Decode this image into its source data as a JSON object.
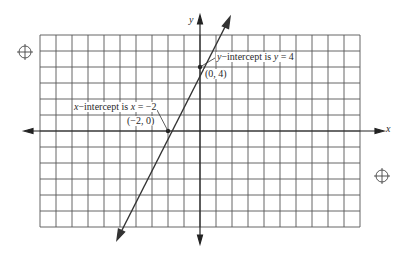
{
  "chart_data": {
    "type": "line",
    "title": "",
    "xlabel": "x",
    "ylabel": "y",
    "xlim": [
      -10,
      10
    ],
    "ylim": [
      -6,
      6
    ],
    "grid": true,
    "grid_step": 1,
    "equation": "y = 2x + 4",
    "series": [
      {
        "name": "line",
        "x": [
          -5,
          -2,
          0,
          1
        ],
        "y": [
          -6,
          0,
          4,
          6
        ],
        "color": "#333333"
      }
    ],
    "points": [
      {
        "label": "(−2, 0)",
        "x": -2,
        "y": 0
      },
      {
        "label": "(0, 4)",
        "x": 0,
        "y": 4
      }
    ],
    "annotations": [
      {
        "text_pre": "x",
        "text_mid": "−intercept is ",
        "text_var": "x",
        "text_post": " = −2",
        "target": [
          -2,
          0
        ]
      },
      {
        "text_pre": "y",
        "text_mid": "−intercept is ",
        "text_var": "y",
        "text_post": " = 4",
        "target": [
          0,
          4
        ]
      }
    ]
  },
  "labels": {
    "x_axis": "x",
    "y_axis": "y",
    "point_x_intercept": "(−2, 0)",
    "point_y_intercept": "(0, 4)",
    "x_int_pre": "x",
    "x_int_mid": "−intercept is ",
    "x_int_var": "x",
    "x_int_post": " = −2",
    "y_int_pre": "y",
    "y_int_mid": "−intercept is ",
    "y_int_var": "y",
    "y_int_post": " = 4"
  },
  "colors": {
    "grid": "#4a4a4a",
    "axis": "#222222",
    "line": "#333333",
    "background": "#ffffff"
  }
}
